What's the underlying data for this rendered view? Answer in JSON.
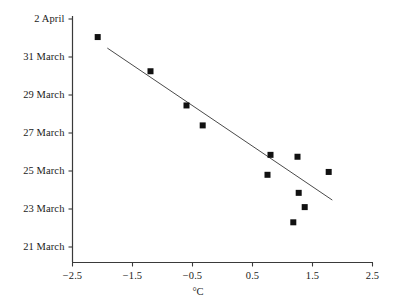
{
  "chart_data": {
    "type": "scatter",
    "title": "",
    "xlabel": "°C",
    "ylabel": "",
    "xlim": [
      -2.5,
      2.5
    ],
    "ylim": [
      20,
      33
    ],
    "grid": false,
    "legend": null,
    "x_ticks": [
      -2.5,
      -1.5,
      -0.5,
      0.5,
      1.5,
      2.5
    ],
    "x_tick_labels": [
      "−2.5",
      "−1.5",
      "−0.5",
      "0.5",
      "1.5",
      "2.5"
    ],
    "y_ticks": [
      33,
      31,
      29,
      27,
      25,
      23,
      21
    ],
    "y_tick_labels": [
      "2 April",
      "31 March",
      "29 March",
      "27 March",
      "25 March",
      "23 March",
      "21 March"
    ],
    "marker": {
      "shape": "square",
      "color": "#111111",
      "size": 6
    },
    "points": [
      {
        "x": -2.08,
        "y": 32.05
      },
      {
        "x": -1.2,
        "y": 30.25
      },
      {
        "x": -0.6,
        "y": 28.45
      },
      {
        "x": -0.33,
        "y": 27.4
      },
      {
        "x": 0.75,
        "y": 24.8
      },
      {
        "x": 0.8,
        "y": 25.85
      },
      {
        "x": 1.25,
        "y": 25.75
      },
      {
        "x": 1.27,
        "y": 23.85
      },
      {
        "x": 1.77,
        "y": 24.95
      },
      {
        "x": 1.37,
        "y": 23.1
      },
      {
        "x": 1.18,
        "y": 22.3
      }
    ],
    "trendline": {
      "style": "solid",
      "color": "#4a4a4a",
      "x_start": -1.92,
      "y_start": 31.47,
      "x_end": 1.83,
      "y_end": 23.47
    }
  },
  "axes": {
    "x_axis_name": "temperature-axis",
    "y_axis_name": "date-axis"
  }
}
